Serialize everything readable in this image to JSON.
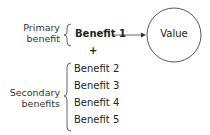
{
  "diagram": {
    "primary": {
      "label_line1": "Primary",
      "label_line2": "benefit",
      "benefit": "Benefit 1"
    },
    "plus": "+",
    "secondary": {
      "label_line1": "Secondary",
      "label_line2": "benefits",
      "benefits": [
        "Benefit 2",
        "Benefit 3",
        "Benefit 4",
        "Benefit 5"
      ]
    },
    "value_node": "Value",
    "colors": {
      "stroke": "#333333",
      "text": "#222222",
      "background": "#ffffff"
    }
  }
}
